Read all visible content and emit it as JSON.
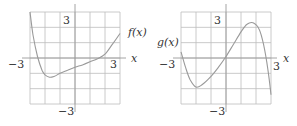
{
  "chart_data": [
    {
      "type": "line",
      "title": "",
      "function_label": "f(x)",
      "xlabel": "x",
      "ylabel": "",
      "xlim": [
        -3,
        3
      ],
      "ylim": [
        -3,
        3
      ],
      "grid": true,
      "tick_labels": {
        "x_left": "−3",
        "x_right": "3",
        "y_top": "3",
        "y_bottom": "−3"
      },
      "x": [
        -3,
        -2.8,
        -2.5,
        -2.2,
        -2,
        -1.7,
        -1.4,
        -1,
        -0.5,
        0,
        0.5,
        1,
        1.5,
        2,
        2.5,
        3
      ],
      "values": [
        3,
        1.5,
        0.1,
        -0.8,
        -1.1,
        -1.25,
        -1.2,
        -1.0,
        -0.8,
        -0.6,
        -0.45,
        -0.25,
        -0.05,
        0.25,
        0.9,
        1.6
      ]
    },
    {
      "type": "line",
      "title": "",
      "function_label": "g(x)",
      "xlabel": "x",
      "ylabel": "",
      "xlim": [
        -3,
        3
      ],
      "ylim": [
        -3,
        3
      ],
      "grid": true,
      "tick_labels": {
        "x_left": "−3",
        "x_right": "3",
        "y_top": "3",
        "y_bottom": "−3"
      },
      "x": [
        -3,
        -2.7,
        -2.4,
        -2,
        -1.6,
        -1,
        -0.5,
        0,
        0.5,
        1,
        1.4,
        1.8,
        2.2,
        2.5,
        2.8,
        3
      ],
      "values": [
        0.4,
        -0.6,
        -1.4,
        -1.9,
        -1.75,
        -1.2,
        -0.6,
        0.1,
        0.9,
        1.7,
        2.2,
        2.3,
        1.9,
        0.9,
        -0.8,
        -2.4
      ]
    }
  ],
  "labels": {
    "f_label": "f(x)",
    "g_label": "g(x)",
    "x_axis": "x",
    "tick_pos": "3",
    "tick_neg": "−3"
  }
}
